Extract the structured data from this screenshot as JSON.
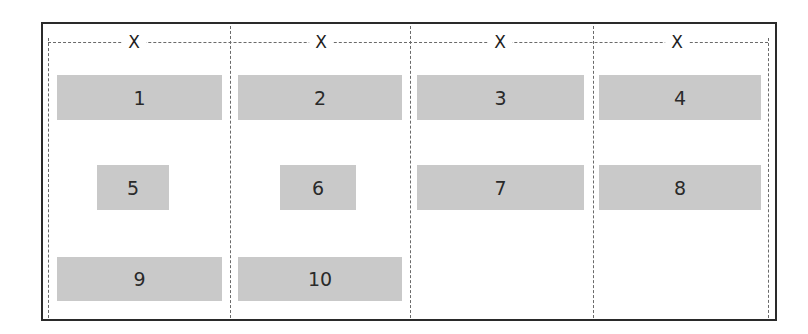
{
  "diagram": {
    "title": "",
    "column_track_label": "X",
    "columns": [
      {
        "label": "X"
      },
      {
        "label": "X"
      },
      {
        "label": "X"
      },
      {
        "label": "X"
      }
    ],
    "items": [
      {
        "label": "1",
        "row": 1,
        "col": 1,
        "fills_track": true
      },
      {
        "label": "2",
        "row": 1,
        "col": 2,
        "fills_track": true
      },
      {
        "label": "3",
        "row": 1,
        "col": 3,
        "fills_track": true
      },
      {
        "label": "4",
        "row": 1,
        "col": 4,
        "fills_track": true
      },
      {
        "label": "5",
        "row": 2,
        "col": 1,
        "fills_track": false
      },
      {
        "label": "6",
        "row": 2,
        "col": 2,
        "fills_track": false
      },
      {
        "label": "7",
        "row": 2,
        "col": 3,
        "fills_track": true
      },
      {
        "label": "8",
        "row": 2,
        "col": 4,
        "fills_track": true
      },
      {
        "label": "9",
        "row": 3,
        "col": 1,
        "fills_track": true
      },
      {
        "label": "10",
        "row": 3,
        "col": 2,
        "fills_track": true
      }
    ],
    "colors": {
      "item_fill": "#c9c9c9",
      "border": "#2a2a2a",
      "grid_lines": "#6a6a6a",
      "text": "#2a2a2a"
    }
  }
}
